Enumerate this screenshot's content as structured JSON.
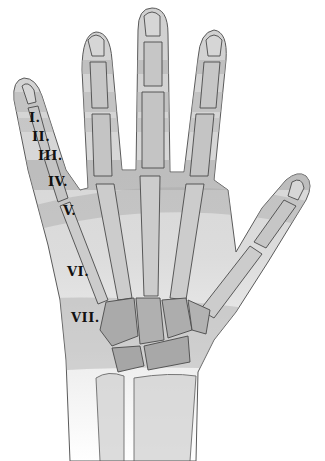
{
  "figure": {
    "colors": {
      "background": "#ffffff",
      "skin": "#d4d4d4",
      "skin_light": "#e6e6e6",
      "band_dark": "#a9a9a9",
      "bone": "#c8c8c8",
      "bone_dark": "#9e9e9e",
      "outline": "#4a4a4a",
      "label": "#111111"
    }
  },
  "zones": [
    {
      "label": "I.",
      "x": 29,
      "y": 111
    },
    {
      "label": "II.",
      "x": 32,
      "y": 130
    },
    {
      "label": "III.",
      "x": 38,
      "y": 149
    },
    {
      "label": "IV.",
      "x": 48,
      "y": 175
    },
    {
      "label": "V.",
      "x": 63,
      "y": 204
    },
    {
      "label": "VI.",
      "x": 67,
      "y": 265
    },
    {
      "label": "VII.",
      "x": 71,
      "y": 311
    }
  ]
}
